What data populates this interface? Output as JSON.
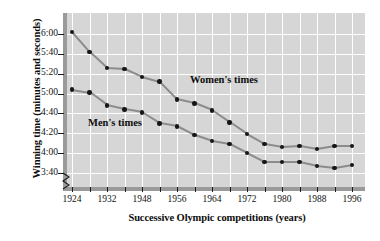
{
  "chart_data": {
    "type": "line",
    "title": "",
    "xlabel": "Successive Olympic competitions (years)",
    "ylabel": "Winning time (minutes and seconds)",
    "x": [
      1924,
      1928,
      1932,
      1936,
      1948,
      1952,
      1956,
      1960,
      1964,
      1968,
      1972,
      1976,
      1980,
      1984,
      1988,
      1992,
      1996
    ],
    "x_tick_labels": [
      "1924",
      "1932",
      "1948",
      "1956",
      "1964",
      "1972",
      "1980",
      "1988",
      "1996"
    ],
    "x_tick_values": [
      1924,
      1932,
      1948,
      1956,
      1964,
      1972,
      1980,
      1988,
      1996
    ],
    "y_tick_labels": [
      "6:00",
      "5:40",
      "5:20",
      "5:00",
      "4:40",
      "4:20",
      "4:00",
      "3:40"
    ],
    "y_tick_seconds": [
      360,
      340,
      320,
      300,
      280,
      260,
      240,
      220
    ],
    "ylim_seconds": [
      215,
      368
    ],
    "y_axis_break": true,
    "grid": true,
    "legend": "inline-labels",
    "series": [
      {
        "name": "Women's times",
        "label_text": "Women's times",
        "marker": "filled-circle",
        "values_text": [
          "6:02",
          "5:42",
          "5:26",
          "5:25",
          "5:17",
          "5:12",
          "4:54",
          "4:50",
          "4:43",
          "4:31",
          "4:19",
          "4:09",
          "4:06",
          "4:07",
          "4:04",
          "4:07",
          "4:07"
        ],
        "values_seconds": [
          362,
          342,
          326,
          325,
          317,
          312,
          294,
          290,
          283,
          271,
          259,
          249,
          246,
          247,
          244,
          247,
          247
        ]
      },
      {
        "name": "Men's times",
        "label_text": "Men's times",
        "marker": "filled-circle",
        "values_text": [
          "5:04",
          "5:01",
          "4:48",
          "4:44",
          "4:41",
          "4:30",
          "4:27",
          "4:18",
          "4:12",
          "4:09",
          "4:00",
          "3:51",
          "3:51",
          "3:51",
          "3:47",
          "3:45",
          "3:48"
        ],
        "values_seconds": [
          304,
          301,
          288,
          284,
          281,
          270,
          267,
          258,
          252,
          249,
          240,
          231,
          231,
          231,
          227,
          225,
          228
        ]
      }
    ],
    "colors": {
      "plot_background": "#d6d6d6",
      "gridline": "#ffffff",
      "line": "#8c8c8c",
      "marker": "#161616",
      "axis": "#9a9a9a",
      "text": "#0d0d0d"
    }
  }
}
